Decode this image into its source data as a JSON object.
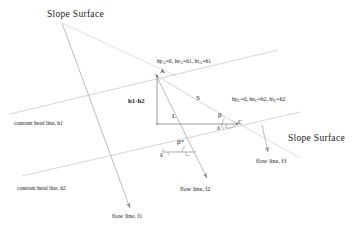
{
  "figure": {
    "type": "engineering-diagram",
    "background_color": "#ffffff",
    "line_color": "#9a9a9a",
    "text_color": "#1a1a1a"
  },
  "labels": {
    "slope_surface_left": "Slope Surface",
    "slope_surface_right": "Slope Surface",
    "constant_head_line_h1": "constant head line, h1",
    "constant_head_line_h2": "constant head line, h2",
    "flow_line_f1": "flow line, f1",
    "flow_line_f2": "flow line, f2",
    "flow_line_f3": "flow line, f3",
    "point_a": "A",
    "point_c": "C",
    "segment_vertical": "h1-h2",
    "segment_hypotenuse": "S",
    "segment_horizontal": "L",
    "angle_beta_c": "β",
    "angle_delta_c": "δ",
    "angle_beta_star": "β*",
    "angle_delta_star": "δ"
  },
  "head_annotations": {
    "point_a": {
      "pressure_head": "hp",
      "pressure_head_sub": "A",
      "pressure_head_value": "=0",
      "elevation_head": "he",
      "elevation_head_sub": "A",
      "elevation_head_value": "=h1",
      "total_head": "ht",
      "total_head_sub": "A",
      "total_head_value": "=h1",
      "full_text": "hpA=0, heA=h1, htA=h1"
    },
    "point_c": {
      "pressure_head": "hp",
      "pressure_head_sub": "C",
      "pressure_head_value": "=0",
      "elevation_head": "he",
      "elevation_head_sub": "C",
      "elevation_head_value": "=h2",
      "total_head": "ht",
      "total_head_sub": "C",
      "total_head_value": "=h2",
      "full_text": "hpC=0, heC=h2, htC=h2"
    }
  }
}
